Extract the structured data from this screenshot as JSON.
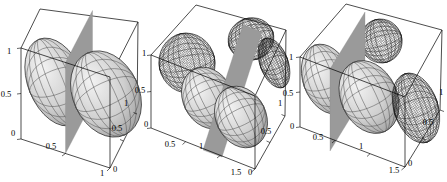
{
  "figure": {
    "background": "#ffffff"
  },
  "colors": {
    "plane": "#9a9a9a",
    "surface_light": "#f3f3f3",
    "surface_dark": "#8e8e8e",
    "mesh_line": "#333333",
    "box_edge": "#000000",
    "label": "#000000"
  },
  "panels": [
    {
      "name": "left-plot",
      "z_ticks": [
        "1",
        "0.5",
        "0"
      ],
      "x_ticks": [
        "0.5",
        "1"
      ],
      "y_ticks": [
        "0",
        "0.5",
        "1"
      ]
    },
    {
      "name": "middle-plot",
      "z_ticks": [
        "1",
        "0.5",
        "0"
      ],
      "x_ticks": [
        "0.5",
        "1",
        "1.5"
      ],
      "y_ticks": [
        "0",
        "0.5",
        "1"
      ]
    },
    {
      "name": "right-plot",
      "z_ticks": [
        "1",
        "0.5",
        "0"
      ],
      "x_ticks": [
        "0.5",
        "1",
        "1.5"
      ],
      "y_ticks": [
        "0",
        "0.5",
        "1"
      ]
    }
  ],
  "chart_data": [
    {
      "type": "3d-surface",
      "title": "",
      "xlabel": "",
      "ylabel": "",
      "zlabel": "",
      "xlim": [
        0,
        1
      ],
      "ylim": [
        0,
        1
      ],
      "zlim": [
        0,
        1
      ],
      "x_ticks": [
        0.5,
        1
      ],
      "y_ticks": [
        0,
        0.5,
        1
      ],
      "z_ticks": [
        0,
        0.5,
        1
      ],
      "grid": false,
      "legend": "none",
      "objects": [
        "shaded mesh ellipsoid left of plane, centered near x=0.25, y=0.5, z=0.5",
        "solid gray vertical plane at x=0.5 spanning full y and z",
        "shaded mesh ellipsoid right of plane, centered near x=0.75, y=0.5, z=0.5"
      ]
    },
    {
      "type": "3d-surface",
      "title": "",
      "xlabel": "",
      "ylabel": "",
      "zlabel": "",
      "xlim": [
        0,
        1.5
      ],
      "ylim": [
        0,
        1
      ],
      "zlim": [
        0,
        1
      ],
      "x_ticks": [
        0.5,
        1,
        1.5
      ],
      "y_ticks": [
        0,
        0.5,
        1
      ],
      "z_ticks": [
        0,
        0.5,
        1
      ],
      "grid": false,
      "legend": "none",
      "objects": [
        "dark wireframe ellipsoid disk at back-left wall",
        "shaded mesh ellipsoid pair in the middle",
        "tilted gray plane slicing diagonally between the ellipsoids",
        "dark wireframe half-ellipsoid at top back",
        "dark wireframe half-ellipsoid at right wall"
      ]
    },
    {
      "type": "3d-surface",
      "title": "",
      "xlabel": "",
      "ylabel": "",
      "zlabel": "",
      "xlim": [
        0,
        1.5
      ],
      "ylim": [
        0,
        1
      ],
      "zlim": [
        0,
        1
      ],
      "x_ticks": [
        0.5,
        1,
        1.5
      ],
      "y_ticks": [
        0,
        0.5,
        1
      ],
      "z_ticks": [
        0,
        0.5,
        1
      ],
      "grid": false,
      "legend": "none",
      "objects": [
        "shaded mesh ellipsoid left of vertical plane",
        "solid gray vertical plane near x=0.5",
        "shaded mesh ellipsoid right of plane",
        "dark wireframe half-ellipsoid at top back",
        "dark wireframe ellipsoid disk at right wall"
      ]
    }
  ]
}
